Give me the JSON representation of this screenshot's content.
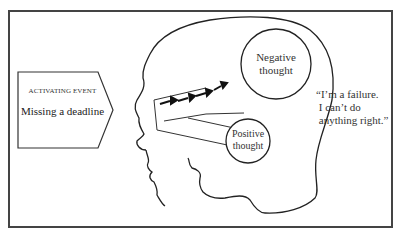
{
  "diagram": {
    "activating_event": {
      "label": "ACTIVATING EVENT",
      "text": "Missing a deadline"
    },
    "negative_thought": {
      "label": "Negative thought"
    },
    "positive_thought": {
      "label": "Positive thought"
    },
    "quote": "“I’m a failure.\n I can’t do\n anything right.”",
    "colors": {
      "line": "#222222",
      "frame": "#444444",
      "background": "#ffffff"
    }
  }
}
